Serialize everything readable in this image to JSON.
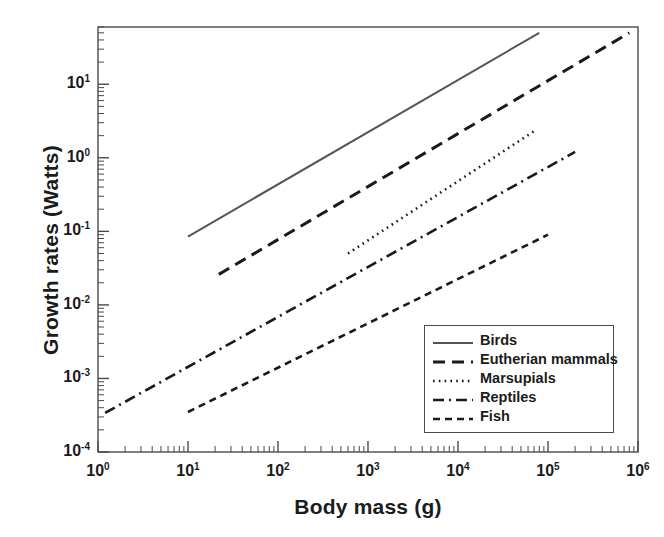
{
  "chart_data": {
    "type": "line",
    "title": "",
    "xlabel": "Body mass (g)",
    "ylabel": "Growth rates (Watts)",
    "xscale": "log",
    "yscale": "log",
    "xlim": [
      1,
      1000000
    ],
    "ylim": [
      0.0001,
      60
    ],
    "grid": false,
    "legend_position": "lower right",
    "xticks": [
      {
        "value": 1,
        "label": "10",
        "exp": "0"
      },
      {
        "value": 10,
        "label": "10",
        "exp": "1"
      },
      {
        "value": 100,
        "label": "10",
        "exp": "2"
      },
      {
        "value": 1000,
        "label": "10",
        "exp": "3"
      },
      {
        "value": 10000,
        "label": "10",
        "exp": "4"
      },
      {
        "value": 100000,
        "label": "10",
        "exp": "5"
      },
      {
        "value": 1000000,
        "label": "10",
        "exp": "6"
      }
    ],
    "yticks": [
      {
        "value": 10,
        "label": "10",
        "exp": "1"
      },
      {
        "value": 1,
        "label": "10",
        "exp": "0"
      },
      {
        "value": 0.1,
        "label": "10",
        "exp": "-1"
      },
      {
        "value": 0.01,
        "label": "10",
        "exp": "-2"
      },
      {
        "value": 0.001,
        "label": "10",
        "exp": "-3"
      },
      {
        "value": 0.0001,
        "label": "10",
        "exp": "-4"
      }
    ],
    "series": [
      {
        "name": "Birds",
        "style": "solid",
        "color": "#555555",
        "x": [
          10,
          80000
        ],
        "y": [
          0.085,
          50
        ]
      },
      {
        "name": "Eutherian mammals",
        "style": "dashed",
        "color": "#1a1a1a",
        "x": [
          22,
          800000
        ],
        "y": [
          0.026,
          50
        ]
      },
      {
        "name": "Marsupials",
        "style": "dotted",
        "color": "#1a1a1a",
        "x": [
          600,
          70000
        ],
        "y": [
          0.05,
          2.3
        ]
      },
      {
        "name": "Reptiles",
        "style": "dashdot",
        "color": "#1a1a1a",
        "x": [
          1.2,
          200000
        ],
        "y": [
          0.00034,
          1.2
        ]
      },
      {
        "name": "Fish",
        "style": "smalldash",
        "color": "#1a1a1a",
        "x": [
          10,
          100000
        ],
        "y": [
          0.00035,
          0.09
        ]
      }
    ]
  },
  "legend": {
    "entries": [
      {
        "label": "Birds"
      },
      {
        "label": "Eutherian mammals"
      },
      {
        "label": "Marsupials"
      },
      {
        "label": "Reptiles"
      },
      {
        "label": "Fish"
      }
    ]
  }
}
